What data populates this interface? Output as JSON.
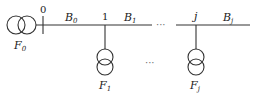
{
  "diagram": {
    "type": "radial distribution feeder",
    "nodes": [
      {
        "id": "0",
        "label": "0"
      },
      {
        "id": "1",
        "label": "1"
      },
      {
        "id": "j",
        "label": "j"
      }
    ],
    "branches": [
      {
        "label": "B",
        "sub": "0"
      },
      {
        "label": "B",
        "sub": "1"
      },
      {
        "label": "B",
        "sub": "j"
      }
    ],
    "sources": [
      {
        "label": "F",
        "sub": "0"
      },
      {
        "label": "F",
        "sub": "1"
      },
      {
        "label": "F",
        "sub": "j"
      }
    ],
    "ellipsis_line": "···",
    "ellipsis_mid": "···"
  }
}
